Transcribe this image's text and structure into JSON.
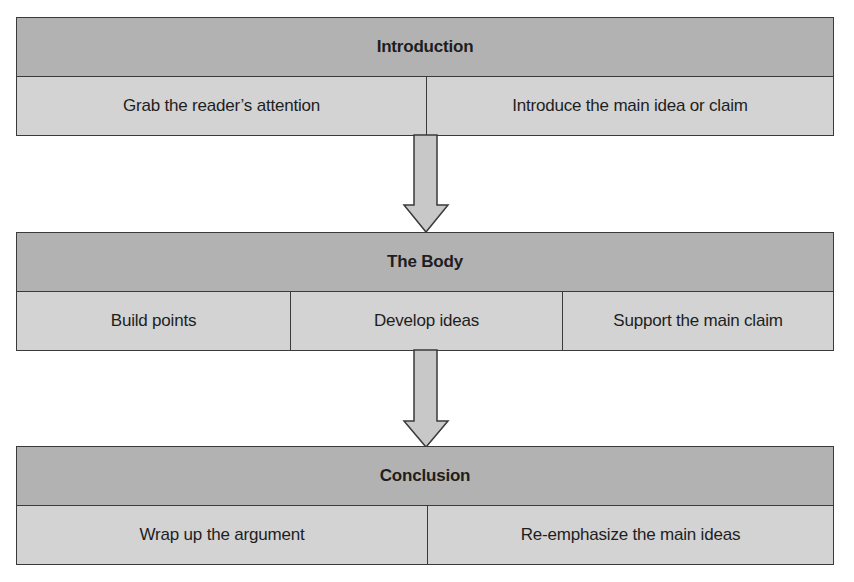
{
  "diagram": {
    "colors": {
      "header_fill": "#b2b2b2",
      "row_fill": "#d3d3d3",
      "border": "#3a3a3a",
      "arrow_fill": "#c8c8c8"
    },
    "sections": [
      {
        "title": "Introduction",
        "items": [
          "Grab the reader’s attention",
          "Introduce the main idea or claim"
        ]
      },
      {
        "title": "The Body",
        "items": [
          "Build points",
          "Develop ideas",
          "Support the main claim"
        ]
      },
      {
        "title": "Conclusion",
        "items": [
          "Wrap up the argument",
          "Re-emphasize the main ideas"
        ]
      }
    ],
    "arrows": [
      {
        "from": "Introduction",
        "to": "The Body",
        "icon": "arrow-down-icon"
      },
      {
        "from": "The Body",
        "to": "Conclusion",
        "icon": "arrow-down-icon"
      }
    ]
  }
}
